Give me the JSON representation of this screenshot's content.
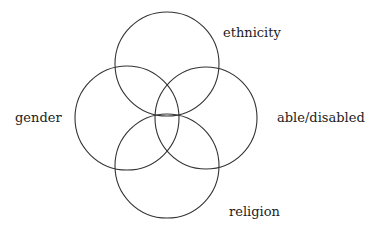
{
  "diagram": {
    "type": "venn",
    "stroke_color": "#333333",
    "background": "#ffffff",
    "circles": [
      {
        "id": "ethnicity",
        "label": "ethnicity",
        "cx": 167,
        "cy": 64,
        "r": 52,
        "label_x": 223,
        "label_y": 37
      },
      {
        "id": "gender",
        "label": "gender",
        "cx": 127,
        "cy": 118,
        "r": 52,
        "label_x": 15,
        "label_y": 122
      },
      {
        "id": "able-disabled",
        "label": "able/disabled",
        "cx": 206,
        "cy": 118,
        "r": 51,
        "label_x": 277,
        "label_y": 122
      },
      {
        "id": "religion",
        "label": "religion",
        "cx": 167,
        "cy": 166,
        "r": 52,
        "label_x": 229,
        "label_y": 216
      }
    ]
  }
}
